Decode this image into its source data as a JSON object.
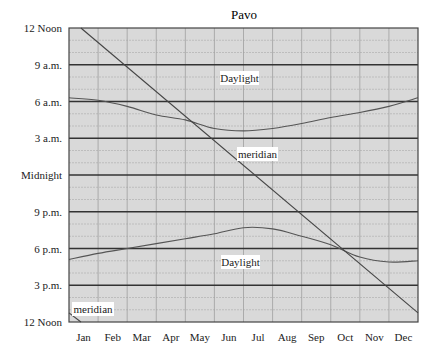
{
  "chart_data": {
    "type": "line",
    "title": "Pavo",
    "xlabel": "",
    "ylabel": "",
    "x_categories": [
      "Jan",
      "Feb",
      "Mar",
      "Apr",
      "May",
      "Jun",
      "Jul",
      "Aug",
      "Sep",
      "Oct",
      "Nov",
      "Dec"
    ],
    "y_tick_labels": [
      "12 Noon",
      "9 a.m.",
      "6 a.m.",
      "3 a.m.",
      "Midnight",
      "9 p.m.",
      "6 p.m.",
      "3 p.m.",
      "12 Noon"
    ],
    "y_axis_note": "Time of night, from 12 Noon (top) down through Midnight to 12 Noon (bottom); 24 hours",
    "grid": {
      "major_every_hours": 3,
      "minor_every_hours": 1,
      "vertical_month_lines": true
    },
    "series": [
      {
        "name": "Daylight (morning twilight boundary)",
        "label": "Daylight",
        "x_month_position": [
          0,
          1,
          2,
          3,
          4,
          5,
          6,
          7,
          8,
          9,
          10,
          11,
          12
        ],
        "hours_after_noon": [
          18.3,
          18.1,
          17.6,
          16.9,
          16.5,
          15.8,
          15.6,
          15.8,
          16.2,
          16.7,
          17.1,
          17.6,
          18.3
        ],
        "time_readable": [
          "7:40 a.m.",
          "7:30 a.m.",
          "6:55 a.m.",
          "6:15 a.m.",
          "5:35 a.m.",
          "5:00 a.m.",
          "4:50 a.m.",
          "5:05 a.m.",
          "5:30 a.m.",
          "6:00 a.m.",
          "6:30 a.m.",
          "6:55 a.m.",
          "7:35 a.m."
        ]
      },
      {
        "name": "Daylight (evening twilight boundary)",
        "label": "Daylight",
        "x_month_position": [
          0,
          1,
          2,
          3,
          4,
          5,
          6,
          7,
          8,
          9,
          10,
          11,
          12
        ],
        "hours_after_noon": [
          5.1,
          5.6,
          6.0,
          6.4,
          6.8,
          7.2,
          7.7,
          7.6,
          7.0,
          6.3,
          5.3,
          4.9,
          5.0
        ],
        "time_readable": [
          "5:05 p.m.",
          "5:35 p.m.",
          "6:00 p.m.",
          "6:25 p.m.",
          "6:50 p.m.",
          "7:10 p.m.",
          "7:40 p.m.",
          "7:35 p.m.",
          "7:00 p.m.",
          "6:20 p.m.",
          "5:20 p.m.",
          "4:55 p.m.",
          "5:00 p.m."
        ]
      },
      {
        "name": "Meridian transit",
        "label": "meridian",
        "note": "Straight line decreasing ~2 hours per month; wraps from 12 Noon at bottom to top",
        "x_month_position": [
          0.41,
          12.0
        ],
        "hours_after_noon": [
          24.0,
          0.75
        ],
        "wrap_segment": {
          "x_month_position": [
            0.0,
            0.41
          ],
          "hours_after_noon": [
            0.75,
            0.0
          ]
        }
      }
    ],
    "annotations": [
      {
        "text": "Daylight",
        "position": "upper, near Jun"
      },
      {
        "text": "meridian",
        "position": "middle, near Jul"
      },
      {
        "text": "Daylight",
        "position": "lower, near Jun"
      },
      {
        "text": "meridian",
        "position": "bottom-left, near Jan"
      }
    ],
    "colors": {
      "background": "#d9d9d9",
      "major_grid": "#333333",
      "minor_grid": "#bdbdbd",
      "vertical_grid": "#a0a0a0",
      "curve": "#555555",
      "meridian_line": "#444444"
    }
  }
}
